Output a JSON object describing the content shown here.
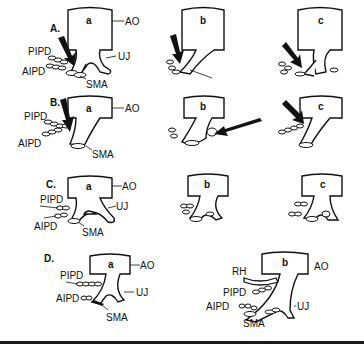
{
  "figure": {
    "rows": [
      {
        "label": "A.",
        "panels": [
          {
            "id": "a",
            "annotations": [
              "AO",
              "UJ",
              "PIPD",
              "AIPD",
              "SMA"
            ],
            "arrow": true
          },
          {
            "id": "b",
            "annotations": [],
            "arrow": true
          },
          {
            "id": "c",
            "annotations": [],
            "arrow": true
          }
        ]
      },
      {
        "label": "B.",
        "panels": [
          {
            "id": "a",
            "annotations": [
              "AO",
              "PIPD",
              "AIPD",
              "SMA"
            ],
            "arrow": true
          },
          {
            "id": "b",
            "annotations": [],
            "arrow": true
          },
          {
            "id": "c",
            "annotations": [],
            "arrow": true
          }
        ]
      },
      {
        "label": "C.",
        "panels": [
          {
            "id": "a",
            "annotations": [
              "AO",
              "UJ",
              "PIPD",
              "AIPD",
              "SMA"
            ],
            "arrow": false
          },
          {
            "id": "b",
            "annotations": [],
            "arrow": false
          },
          {
            "id": "c",
            "annotations": [],
            "arrow": false
          }
        ]
      },
      {
        "label": "D.",
        "panels": [
          {
            "id": "a",
            "annotations": [
              "AO",
              "UJ",
              "PIPD",
              "AIPD",
              "SMA"
            ],
            "arrow": false
          },
          {
            "id": "b",
            "annotations": [
              "RH",
              "AO",
              "PIPD",
              "UJ",
              "AIPD",
              "SMA"
            ],
            "arrow": false
          }
        ]
      }
    ],
    "labels": {
      "ao": "AO",
      "uj": "UJ",
      "pipd": "PIPD",
      "aipd": "AIPD",
      "sma": "SMA",
      "rh": "RH",
      "a": "a",
      "b": "b",
      "c": "c",
      "rowA": "A.",
      "rowB": "B.",
      "rowC": "C.",
      "rowD": "D."
    }
  }
}
